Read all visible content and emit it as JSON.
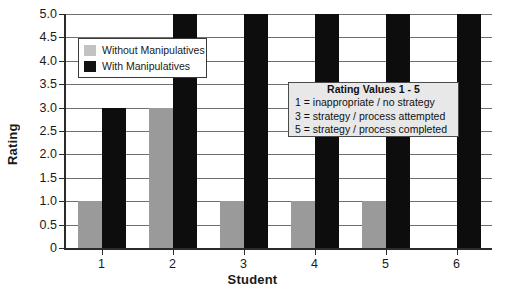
{
  "chart_data": {
    "type": "bar",
    "title": "",
    "xlabel": "Student",
    "ylabel": "Rating",
    "categories": [
      "1",
      "2",
      "3",
      "4",
      "5",
      "6"
    ],
    "series": [
      {
        "name": "Without Manipulatives",
        "color": "#9a9a9a",
        "values": [
          1.0,
          3.0,
          1.0,
          1.0,
          1.0,
          0
        ]
      },
      {
        "name": "With Manipulatives",
        "color": "#0d0d0d",
        "values": [
          3.0,
          5.0,
          5.0,
          5.0,
          5.0,
          5.0
        ]
      }
    ],
    "ylim": [
      0,
      5
    ],
    "ytick_values": [
      0,
      0.5,
      1.0,
      1.5,
      2.0,
      2.5,
      3.0,
      3.5,
      4.0,
      4.5,
      5.0
    ],
    "ytick_labels": [
      "0",
      "0.5",
      "1.0",
      "1.5",
      "2.0",
      "2.5",
      "3.0",
      "3.5",
      "4.0",
      "4.5",
      "5.0"
    ],
    "grid": true,
    "legend_position": "upper-left-inside"
  },
  "legend": {
    "items": [
      {
        "label": "Without Manipulatives",
        "swatch": "gray-swatch"
      },
      {
        "label": "With Manipulatives",
        "swatch": "black-swatch"
      }
    ]
  },
  "info_box": {
    "title": "Rating Values 1 - 5",
    "lines": [
      "1 = inappropriate / no strategy",
      "3 = strategy / process attempted",
      "5 = strategy / process completed"
    ]
  }
}
